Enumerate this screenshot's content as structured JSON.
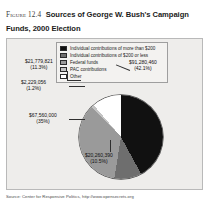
{
  "figure": {
    "label": "Figure 12.4",
    "title": "Sources of George W. Bush's Campaign Funds, 2000 Election",
    "source": "Source: Center for Responsive Politics, http://www.opensecrets.org"
  },
  "legend": {
    "items": [
      {
        "label": "Individual contributions of more than $200",
        "swatch": "black-swatch-icon"
      },
      {
        "label": "Individual contributions of $200 or less",
        "swatch": "dark-gray-swatch-icon"
      },
      {
        "label": "Federal funds",
        "swatch": "mid-gray-swatch-icon"
      },
      {
        "label": "PAC contributions",
        "swatch": "light-gray-swatch-icon"
      },
      {
        "label": "Other",
        "swatch": "white-swatch-icon"
      }
    ]
  },
  "labels": {
    "a": {
      "amount": "$21,779,821",
      "percent": "(11.3%)"
    },
    "b": {
      "amount": "$2,229,056",
      "percent": "(1.2%)"
    },
    "c": {
      "amount": "$67,560,000",
      "percent": "(35%)"
    },
    "d": {
      "amount": "$91,280,460",
      "percent": "(42.1%)"
    },
    "e": {
      "amount": "$20,260,390",
      "percent": "(10.5%)"
    }
  },
  "chart_data": {
    "type": "pie",
    "title": "Sources of George W. Bush's Campaign Funds, 2000 Election",
    "categories": [
      "Individual contributions of more than $200",
      "Individual contributions of $200 or less",
      "Federal funds",
      "PAC contributions",
      "Other"
    ],
    "values": [
      42.1,
      10.5,
      35,
      1.2,
      11.3
    ],
    "amounts": [
      91280460,
      20260390,
      67560000,
      2229056,
      21779821
    ],
    "value_labels": [
      "$91,280,460",
      "$20,260,390",
      "$67,560,000",
      "$2,229,056",
      "$21,779,821"
    ],
    "percent_labels": [
      "(42.1%)",
      "(10.5%)",
      "(35%)",
      "(1.2%)",
      "(11.3%)"
    ],
    "colors": [
      "#111111",
      "#6e6e6e",
      "#9a9a9a",
      "#c3c3c3",
      "#ffffff"
    ],
    "legend_position": "top",
    "grid": false,
    "xlabel": "",
    "ylabel": "",
    "source": "Source: Center for Responsive Politics, http://www.opensecrets.org"
  }
}
